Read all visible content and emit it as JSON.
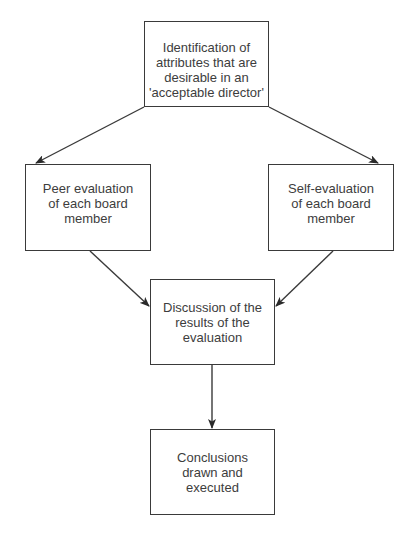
{
  "diagram": {
    "type": "flowchart",
    "nodes": [
      {
        "id": "top",
        "label": "Identification of\nattributes that are\ndesirable in an\n'acceptable director'"
      },
      {
        "id": "left",
        "label": "Peer evaluation\nof each board\nmember"
      },
      {
        "id": "right",
        "label": "Self-evaluation\nof each board\nmember"
      },
      {
        "id": "middle",
        "label": "Discussion of the\nresults of the\nevaluation"
      },
      {
        "id": "bottom",
        "label": "Conclusions\ndrawn and\nexecuted"
      }
    ],
    "edges": [
      {
        "from": "top",
        "to": "left"
      },
      {
        "from": "top",
        "to": "right"
      },
      {
        "from": "left",
        "to": "middle"
      },
      {
        "from": "right",
        "to": "middle"
      },
      {
        "from": "middle",
        "to": "bottom"
      }
    ],
    "colors": {
      "stroke": "#3a3a3a",
      "text": "#3d3d3d",
      "background": "#ffffff"
    }
  }
}
